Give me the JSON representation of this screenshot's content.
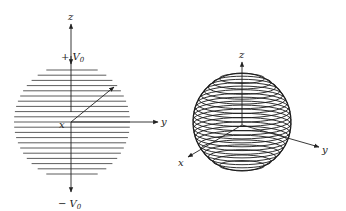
{
  "figure_left": {
    "title": "charged disk (stacked chords)",
    "axis_labels": {
      "z": "z",
      "y": "y",
      "x": "x"
    },
    "top_potential": "+ V",
    "top_potential_sub": "0",
    "bottom_potential": "− V",
    "bottom_potential_sub": "0",
    "chord_count": 21,
    "line_color": "#333333"
  },
  "figure_right": {
    "title": "sphere (stacked rings)",
    "axis_labels": {
      "z": "z",
      "y": "y",
      "x": "x"
    },
    "ring_count": 22,
    "line_color": "#1a1a1a"
  }
}
